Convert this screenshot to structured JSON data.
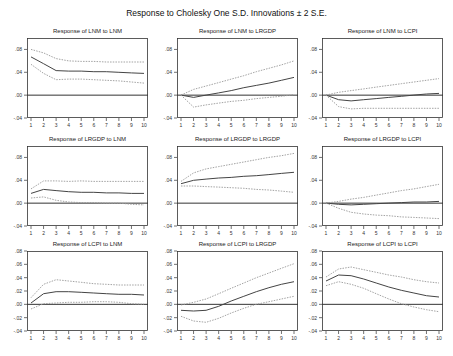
{
  "title": "Response to Cholesky One S.D. Innovations ± 2 S.E.",
  "caption": "",
  "colors": {
    "response": "#444444",
    "band": "#999999",
    "zero": "#333333",
    "axis": "#333333"
  },
  "chart_data": [
    {
      "type": "line",
      "title": "Response of LNM to LNM",
      "x": [
        1,
        2,
        3,
        4,
        5,
        6,
        7,
        8,
        9,
        10
      ],
      "yticks": [
        ".08",
        ".04",
        ".00",
        "-.04"
      ],
      "ylim": [
        -0.04,
        0.1
      ],
      "series": [
        {
          "name": "Response",
          "values": [
            0.067,
            0.055,
            0.043,
            0.042,
            0.042,
            0.041,
            0.041,
            0.04,
            0.039,
            0.038
          ]
        },
        {
          "name": "Upper 2 S.E.",
          "values": [
            0.08,
            0.074,
            0.064,
            0.06,
            0.059,
            0.059,
            0.058,
            0.058,
            0.058,
            0.058
          ]
        },
        {
          "name": "Lower 2 S.E.",
          "values": [
            0.054,
            0.038,
            0.027,
            0.028,
            0.028,
            0.027,
            0.026,
            0.025,
            0.023,
            0.021
          ]
        }
      ]
    },
    {
      "type": "line",
      "title": "Response of LNM to LRGDP",
      "x": [
        1,
        2,
        3,
        4,
        5,
        6,
        7,
        8,
        9,
        10
      ],
      "yticks": [
        ".08",
        ".04",
        ".00",
        "-.04"
      ],
      "ylim": [
        -0.04,
        0.1
      ],
      "series": [
        {
          "name": "Response",
          "values": [
            0.0,
            -0.004,
            0.0,
            0.004,
            0.008,
            0.013,
            0.017,
            0.021,
            0.026,
            0.031
          ]
        },
        {
          "name": "Upper 2 S.E.",
          "values": [
            0.0,
            0.01,
            0.016,
            0.022,
            0.028,
            0.034,
            0.041,
            0.047,
            0.053,
            0.06
          ]
        },
        {
          "name": "Lower 2 S.E.",
          "values": [
            0.0,
            -0.021,
            -0.017,
            -0.014,
            -0.011,
            -0.009,
            -0.006,
            -0.004,
            -0.002,
            0.001
          ]
        }
      ]
    },
    {
      "type": "line",
      "title": "Response of LNM to LCPI",
      "x": [
        1,
        2,
        3,
        4,
        5,
        6,
        7,
        8,
        9,
        10
      ],
      "yticks": [
        ".08",
        ".04",
        ".00",
        "-.04"
      ],
      "ylim": [
        -0.04,
        0.1
      ],
      "series": [
        {
          "name": "Response",
          "values": [
            0.0,
            -0.008,
            -0.01,
            -0.008,
            -0.006,
            -0.004,
            -0.002,
            0.0,
            0.002,
            0.003
          ]
        },
        {
          "name": "Upper 2 S.E.",
          "values": [
            0.0,
            0.005,
            0.008,
            0.011,
            0.014,
            0.017,
            0.02,
            0.023,
            0.026,
            0.029
          ]
        },
        {
          "name": "Lower 2 S.E.",
          "values": [
            0.0,
            -0.02,
            -0.024,
            -0.023,
            -0.023,
            -0.023,
            -0.023,
            -0.023,
            -0.023,
            -0.023
          ]
        }
      ]
    },
    {
      "type": "line",
      "title": "Response of LRGDP to LNM",
      "x": [
        1,
        2,
        3,
        4,
        5,
        6,
        7,
        8,
        9,
        10
      ],
      "yticks": [
        ".08",
        ".04",
        ".00",
        "-.04"
      ],
      "ylim": [
        -0.04,
        0.1
      ],
      "series": [
        {
          "name": "Response",
          "values": [
            0.017,
            0.024,
            0.022,
            0.02,
            0.019,
            0.019,
            0.018,
            0.018,
            0.017,
            0.017
          ]
        },
        {
          "name": "Upper 2 S.E.",
          "values": [
            0.025,
            0.039,
            0.039,
            0.038,
            0.039,
            0.038,
            0.038,
            0.038,
            0.038,
            0.038
          ]
        },
        {
          "name": "Lower 2 S.E.",
          "values": [
            0.009,
            0.011,
            0.005,
            0.002,
            0.001,
            0.001,
            0.0,
            0.0,
            -0.002,
            -0.003
          ]
        }
      ]
    },
    {
      "type": "line",
      "title": "Response of LRGDP to LRGDP",
      "x": [
        1,
        2,
        3,
        4,
        5,
        6,
        7,
        8,
        9,
        10
      ],
      "yticks": [
        ".08",
        ".04",
        ".00",
        "-.04"
      ],
      "ylim": [
        -0.04,
        0.1
      ],
      "series": [
        {
          "name": "Response",
          "values": [
            0.034,
            0.04,
            0.042,
            0.044,
            0.045,
            0.047,
            0.048,
            0.05,
            0.052,
            0.054
          ]
        },
        {
          "name": "Upper 2 S.E.",
          "values": [
            0.038,
            0.053,
            0.06,
            0.064,
            0.068,
            0.072,
            0.076,
            0.08,
            0.083,
            0.087
          ]
        },
        {
          "name": "Lower 2 S.E.",
          "values": [
            0.03,
            0.03,
            0.029,
            0.028,
            0.027,
            0.026,
            0.024,
            0.023,
            0.021,
            0.019
          ]
        }
      ]
    },
    {
      "type": "line",
      "title": "Response of LRGDP to LCPI",
      "x": [
        1,
        2,
        3,
        4,
        5,
        6,
        7,
        8,
        9,
        10
      ],
      "yticks": [
        ".08",
        ".04",
        ".00",
        "-.04"
      ],
      "ylim": [
        -0.04,
        0.1
      ],
      "series": [
        {
          "name": "Response",
          "values": [
            0.0,
            -0.002,
            -0.003,
            -0.002,
            -0.001,
            0.0,
            0.001,
            0.002,
            0.002,
            0.003
          ]
        },
        {
          "name": "Upper 2 S.E.",
          "values": [
            0.0,
            0.003,
            0.007,
            0.01,
            0.014,
            0.018,
            0.022,
            0.025,
            0.029,
            0.033
          ]
        },
        {
          "name": "Lower 2 S.E.",
          "values": [
            0.0,
            -0.009,
            -0.016,
            -0.019,
            -0.021,
            -0.022,
            -0.024,
            -0.025,
            -0.026,
            -0.027
          ]
        }
      ]
    },
    {
      "type": "line",
      "title": "Response of LCPI to LNM",
      "x": [
        1,
        2,
        3,
        4,
        5,
        6,
        7,
        8,
        9,
        10
      ],
      "yticks": [
        ".08",
        ".06",
        ".04",
        ".02",
        ".00",
        "-.02",
        "-.04"
      ],
      "ylim": [
        -0.04,
        0.08
      ],
      "series": [
        {
          "name": "Response",
          "values": [
            0.002,
            0.016,
            0.019,
            0.019,
            0.018,
            0.017,
            0.016,
            0.015,
            0.015,
            0.014
          ]
        },
        {
          "name": "Upper 2 S.E.",
          "values": [
            0.01,
            0.03,
            0.037,
            0.035,
            0.033,
            0.031,
            0.03,
            0.029,
            0.029,
            0.029
          ]
        },
        {
          "name": "Lower 2 S.E.",
          "values": [
            -0.007,
            0.001,
            0.002,
            0.003,
            0.003,
            0.004,
            0.004,
            0.003,
            0.001,
            0.0
          ]
        }
      ]
    },
    {
      "type": "line",
      "title": "Response of LCPI to LRGDP",
      "x": [
        1,
        2,
        3,
        4,
        5,
        6,
        7,
        8,
        9,
        10
      ],
      "yticks": [
        ".08",
        ".06",
        ".04",
        ".02",
        ".00",
        "-.02",
        "-.04"
      ],
      "ylim": [
        -0.04,
        0.08
      ],
      "series": [
        {
          "name": "Response",
          "values": [
            -0.009,
            -0.01,
            -0.009,
            -0.003,
            0.005,
            0.012,
            0.019,
            0.025,
            0.03,
            0.034
          ]
        },
        {
          "name": "Upper 2 S.E.",
          "values": [
            -0.001,
            0.003,
            0.008,
            0.016,
            0.024,
            0.032,
            0.04,
            0.047,
            0.054,
            0.061
          ]
        },
        {
          "name": "Lower 2 S.E.",
          "values": [
            -0.018,
            -0.025,
            -0.027,
            -0.021,
            -0.013,
            -0.006,
            0.0,
            0.004,
            0.008,
            0.012
          ]
        }
      ]
    },
    {
      "type": "line",
      "title": "Response of LCPI to LCPI",
      "x": [
        1,
        2,
        3,
        4,
        5,
        6,
        7,
        8,
        9,
        10
      ],
      "yticks": [
        ".08",
        ".06",
        ".04",
        ".02",
        ".00",
        "-.02",
        "-.04"
      ],
      "ylim": [
        -0.04,
        0.08
      ],
      "series": [
        {
          "name": "Response",
          "values": [
            0.035,
            0.044,
            0.043,
            0.038,
            0.032,
            0.026,
            0.021,
            0.017,
            0.013,
            0.011
          ]
        },
        {
          "name": "Upper 2 S.E.",
          "values": [
            0.041,
            0.053,
            0.056,
            0.052,
            0.048,
            0.044,
            0.041,
            0.037,
            0.034,
            0.032
          ]
        },
        {
          "name": "Lower 2 S.E.",
          "values": [
            0.028,
            0.034,
            0.03,
            0.024,
            0.016,
            0.008,
            0.001,
            -0.004,
            -0.008,
            -0.011
          ]
        }
      ]
    }
  ]
}
